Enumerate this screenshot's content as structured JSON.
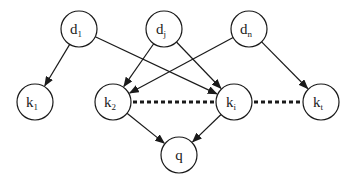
{
  "diagram": {
    "type": "directed-graph",
    "nodes": [
      {
        "id": "d1",
        "base": "d",
        "sub": "1",
        "x": 79,
        "y": 29
      },
      {
        "id": "dj",
        "base": "d",
        "sub": "j",
        "x": 164,
        "y": 29
      },
      {
        "id": "dn",
        "base": "d",
        "sub": "n",
        "x": 249,
        "y": 29
      },
      {
        "id": "k1",
        "base": "k",
        "sub": "1",
        "x": 35,
        "y": 102
      },
      {
        "id": "k2",
        "base": "k",
        "sub": "2",
        "x": 113,
        "y": 102
      },
      {
        "id": "ki",
        "base": "k",
        "sub": "i",
        "x": 234,
        "y": 102
      },
      {
        "id": "kt",
        "base": "k",
        "sub": "t",
        "x": 321,
        "y": 102
      },
      {
        "id": "q",
        "base": "q",
        "sub": "",
        "x": 179,
        "y": 155
      }
    ],
    "edges": [
      {
        "from": "d1",
        "to": "k1"
      },
      {
        "from": "d1",
        "to": "ki"
      },
      {
        "from": "dj",
        "to": "k2"
      },
      {
        "from": "dj",
        "to": "ki"
      },
      {
        "from": "dn",
        "to": "k2"
      },
      {
        "from": "dn",
        "to": "kt"
      },
      {
        "from": "k2",
        "to": "q"
      },
      {
        "from": "ki",
        "to": "q"
      }
    ],
    "ellipsis_links": [
      {
        "from": "k2",
        "to": "ki"
      },
      {
        "from": "ki",
        "to": "kt"
      }
    ]
  }
}
